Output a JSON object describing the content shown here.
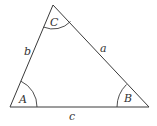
{
  "diagram": {
    "type": "triangle",
    "vertices": {
      "A": {
        "label": "A"
      },
      "B": {
        "label": "B"
      },
      "C": {
        "label": "C"
      }
    },
    "sides": {
      "a": {
        "label": "a",
        "opposite": "A"
      },
      "b": {
        "label": "b",
        "opposite": "B"
      },
      "c": {
        "label": "c",
        "opposite": "C"
      }
    },
    "angle_arcs": [
      "A",
      "B",
      "C"
    ],
    "line_color": "#3a3a3a",
    "text_color": "#333333"
  }
}
